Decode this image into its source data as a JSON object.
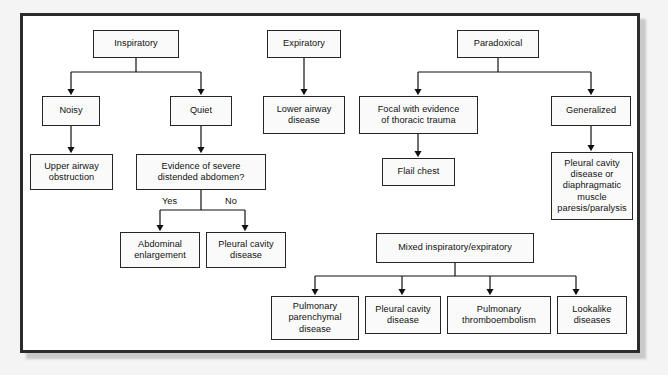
{
  "figure": {
    "type": "flowchart",
    "frame_color": "#2b2b2b",
    "box_fill": "#fafafa",
    "box_border": "#262626",
    "page_background": "#f4f4f4"
  },
  "nodes": {
    "inspiratory": "Inspiratory",
    "noisy": "Noisy",
    "quiet": "Quiet",
    "upper_airway_obstruction": "Upper airway\nobstruction",
    "evidence_distended_abdomen": "Evidence of severe\ndistended abdomen?",
    "abdominal_enlargement": "Abdominal\nenlargement",
    "pleural_cavity_disease_left": "Pleural cavity\ndisease",
    "expiratory": "Expiratory",
    "lower_airway_disease": "Lower airway\ndisease",
    "paradoxical": "Paradoxical",
    "focal_thoracic_trauma": "Focal with evidence\nof thoracic trauma",
    "flail_chest": "Flail chest",
    "generalized": "Generalized",
    "pleural_cavity_or_diaphragmatic": "Pleural cavity\ndisease or\ndiaphragmatic\nmuscle\nparesis/paralysis",
    "mixed_inspiratory_expiratory": "Mixed inspiratory/expiratory",
    "pulmonary_parenchymal_disease": "Pulmonary\nparenchymal\ndisease",
    "pleural_cavity_disease_bottom": "Pleural cavity\ndisease",
    "pulmonary_thromboembolism": "Pulmonary\nthromboembolism",
    "lookalike_diseases": "Lookalike\ndiseases"
  },
  "edge_labels": {
    "yes": "Yes",
    "no": "No"
  }
}
